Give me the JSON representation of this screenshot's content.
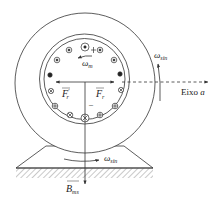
{
  "diagram": {
    "type": "synchronous-machine-cross-section",
    "labels": {
      "rotor_speed": "ω",
      "rotor_speed_sub": "m",
      "sync_speed_right": "ω",
      "sync_speed_right_sub": "sin",
      "sync_speed_bottom": "ω",
      "sync_speed_bottom_sub": "sin",
      "axis": "Eixo",
      "axis_var": "a",
      "force_left": "F",
      "force_left_sub": "r",
      "force_left_prime": "′",
      "force_right": "F",
      "force_right_sub": "r",
      "field": "B",
      "field_sub": "ms",
      "minus_sign": "–"
    },
    "conductors": [
      {
        "position": "top",
        "symbol": "dot"
      },
      {
        "position": "top-left",
        "symbol": "dot"
      },
      {
        "position": "top-right",
        "symbol": "dot"
      },
      {
        "position": "upper-left",
        "symbol": "dot"
      },
      {
        "position": "upper-right",
        "symbol": "dot"
      },
      {
        "position": "left",
        "symbol": "filled"
      },
      {
        "position": "right",
        "symbol": "filled"
      },
      {
        "position": "lower-left",
        "symbol": "cross"
      },
      {
        "position": "lower-right",
        "symbol": "cross"
      },
      {
        "position": "bottom-left-1",
        "symbol": "plus"
      },
      {
        "position": "bottom-right-1",
        "symbol": "plus"
      },
      {
        "position": "bottom-left-2",
        "symbol": "cross"
      },
      {
        "position": "bottom-right-2",
        "symbol": "plus"
      },
      {
        "position": "bottom",
        "symbol": "cross"
      }
    ],
    "colors": {
      "stroke": "#333333",
      "hatch": "#666666",
      "background": "#ffffff"
    }
  }
}
